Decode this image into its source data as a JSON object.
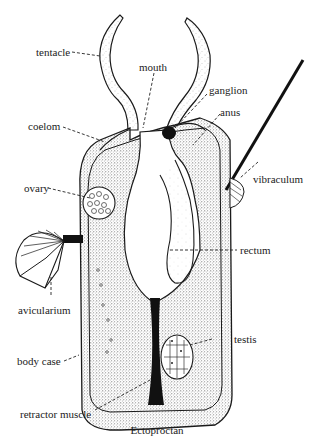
{
  "diagram": {
    "caption": "Ectoproctan",
    "labels": {
      "tentacle": "tentacle",
      "mouth": "mouth",
      "ganglion": "ganglion",
      "anus": "anus",
      "coelom": "coelom",
      "vibraculum": "vibraculum",
      "ovary": "ovary",
      "rectum": "rectum",
      "avicularium": "avicularium",
      "testis": "testis",
      "body_case": "body case",
      "retractor_muscle": "retractor muscle"
    },
    "colors": {
      "ink": "#1a1a1a",
      "stipple": "#9a9a9a",
      "background": "#ffffff"
    }
  }
}
